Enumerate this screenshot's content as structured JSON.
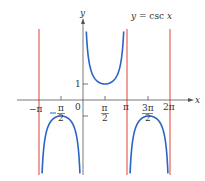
{
  "chart_data": {
    "type": "line",
    "title": "y = csc x",
    "xlabel": "x",
    "ylabel": "y",
    "function": "csc x",
    "xlim": [
      -3.6,
      7.2
    ],
    "ylim": [
      -4.6,
      4.4
    ],
    "grid": false,
    "x_ticks": [
      "-π",
      "-π/2",
      "0",
      "π/2",
      "π",
      "3π/2",
      "2π"
    ],
    "x_tick_values": [
      -3.1416,
      -1.5708,
      0,
      1.5708,
      3.1416,
      4.7124,
      6.2832
    ],
    "y_ticks": [
      "1",
      "-1"
    ],
    "y_tick_values": [
      1,
      -1
    ],
    "asymptotes": {
      "x": [
        -3.1416,
        3.1416,
        6.2832
      ],
      "labels": [
        "-π",
        "π",
        "2π"
      ],
      "color": "#e0413a"
    },
    "series": [
      {
        "name": "csc x on (-π, 0)",
        "color": "#2a64c5",
        "min_point": {
          "x": -1.5708,
          "y": -1
        }
      },
      {
        "name": "csc x on (0, π)",
        "color": "#2a64c5",
        "min_point": {
          "x": 1.5708,
          "y": 1
        }
      },
      {
        "name": "csc x on (π, 2π)",
        "color": "#2a64c5",
        "min_point": {
          "x": 4.7124,
          "y": -1
        }
      }
    ]
  },
  "labels": {
    "title": "y = csc x",
    "title_y": "y",
    "title_eq": "= csc",
    "title_x": "x",
    "axis_x": "x",
    "axis_y": "y",
    "tick_neg_pi": "−π",
    "tick_neg_half_pi_num": "π",
    "tick_neg_half_pi_den": "2",
    "tick_zero": "0",
    "tick_half_pi_num": "π",
    "tick_half_pi_den": "2",
    "tick_pi": "π",
    "tick_3half_pi_num": "3π",
    "tick_3half_pi_den": "2",
    "tick_2pi": "2π",
    "tick_one": "1"
  },
  "colors": {
    "curve": "#2a64c5",
    "asymptote": "#e0413a",
    "axis": "#444444"
  }
}
